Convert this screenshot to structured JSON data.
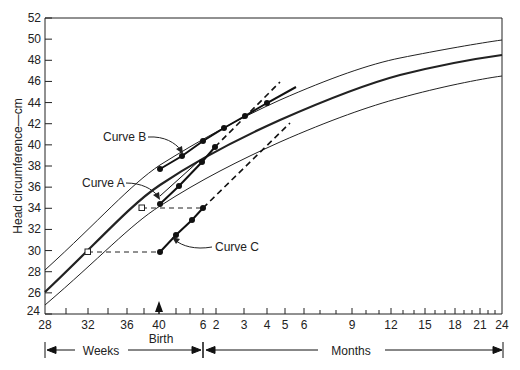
{
  "chart_data": {
    "type": "line",
    "title": "",
    "ylabel": "Head circumference—cm",
    "xlabel": "Age (weeks gestation / months after birth)",
    "ylim": [
      24,
      52
    ],
    "grid": false,
    "y_ticks": [
      "24",
      "26",
      "28",
      "30",
      "32",
      "34",
      "36",
      "38",
      "40",
      "42",
      "44",
      "46",
      "48",
      "50",
      "52"
    ],
    "x_ticks": [
      {
        "label": "28",
        "x": 45
      },
      {
        "label": "32",
        "x": 88
      },
      {
        "label": "36",
        "x": 127
      },
      {
        "label": "40",
        "x": 159
      },
      {
        "label": "6",
        "x": 203
      },
      {
        "label": "2",
        "x": 216
      },
      {
        "label": "3",
        "x": 244
      },
      {
        "label": "4",
        "x": 267
      },
      {
        "label": "5",
        "x": 285
      },
      {
        "label": "6",
        "x": 304
      },
      {
        "label": "9",
        "x": 352
      },
      {
        "label": "12",
        "x": 391
      },
      {
        "label": "15",
        "x": 425
      },
      {
        "label": "18",
        "x": 455
      },
      {
        "label": "21",
        "x": 480
      },
      {
        "label": "24",
        "x": 502
      }
    ],
    "annotations": {
      "birth": "Birth",
      "weeks": "Weeks",
      "months": "Months"
    },
    "series": [
      {
        "name": "Reference upper",
        "style": "thin",
        "points_cm": [
          [
            28,
            27.8
          ],
          [
            40,
            37.8
          ],
          [
            4,
            44.2
          ],
          [
            12,
            48.2
          ],
          [
            24,
            50.8
          ]
        ]
      },
      {
        "name": "Reference mean",
        "style": "thick",
        "points_cm": [
          [
            28,
            26.4
          ],
          [
            40,
            35.8
          ],
          [
            4,
            42.4
          ],
          [
            12,
            46.4
          ],
          [
            24,
            49.6
          ]
        ]
      },
      {
        "name": "Reference lower",
        "style": "thin",
        "points_cm": [
          [
            28,
            25.2
          ],
          [
            40,
            33.8
          ],
          [
            4,
            40.2
          ],
          [
            12,
            44.4
          ],
          [
            24,
            47.8
          ]
        ]
      },
      {
        "name": "Curve A",
        "style": "solid+dashed",
        "points_cm": [
          [
            40,
            34.4
          ],
          [
            42,
            36.2
          ],
          [
            44,
            38.4
          ],
          [
            1.5,
            39.8
          ]
        ],
        "dashed_to_cm": [
          5,
          46
        ]
      },
      {
        "name": "Curve B",
        "style": "solid",
        "points_cm": [
          [
            40,
            37.8
          ],
          [
            42,
            39.0
          ],
          [
            44,
            40.4
          ],
          [
            2,
            41.6
          ],
          [
            3,
            42.8
          ],
          [
            4,
            44.0
          ]
        ],
        "extends_to_cm": [
          5.5,
          45.5
        ]
      },
      {
        "name": "Curve C",
        "style": "solid+dashed",
        "points_cm": [
          [
            40,
            30.0
          ],
          [
            42,
            31.6
          ],
          [
            44,
            33.0
          ],
          [
            46,
            34.0
          ]
        ],
        "dashed_to_cm": [
          5,
          42
        ]
      }
    ],
    "corrected_points": [
      {
        "label": "32 wk, 30 cm",
        "x_wk": 32,
        "y_cm": 30,
        "dashed_to_x_wk": 40
      },
      {
        "label": "37 wk, 34 cm",
        "x_wk": 37,
        "y_cm": 34,
        "dashed_to_x_wk": 46
      }
    ]
  },
  "labels": {
    "curve_a": "Curve A",
    "curve_b": "Curve B",
    "curve_c": "Curve C",
    "ylabel": "Head circumference—cm",
    "birth": "Birth",
    "weeks": "Weeks",
    "months": "Months"
  }
}
